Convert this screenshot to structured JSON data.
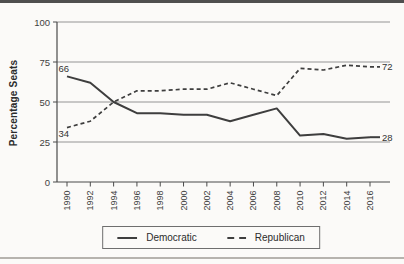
{
  "chart_data": {
    "type": "line",
    "title": "",
    "xlabel": "",
    "ylabel": "Percentage Seats",
    "x": [
      1990,
      1992,
      1994,
      1996,
      1998,
      2000,
      2002,
      2004,
      2006,
      2008,
      2010,
      2012,
      2014,
      2016
    ],
    "y_ticks": [
      0,
      25,
      50,
      75,
      100
    ],
    "ylim": [
      0,
      100
    ],
    "grid": "horizontal",
    "legend_position": "bottom-center",
    "series": [
      {
        "name": "Democratic",
        "style": "solid",
        "color": "#3e3e3e",
        "values": [
          66,
          62,
          50,
          43,
          43,
          42,
          42,
          38,
          42,
          46,
          29,
          30,
          27,
          28
        ],
        "start_label": "66",
        "start_label_pos": "above",
        "end_label": "28"
      },
      {
        "name": "Republican",
        "style": "dashed",
        "color": "#3e3e3e",
        "values": [
          34,
          38,
          50,
          57,
          57,
          58,
          58,
          62,
          58,
          54,
          71,
          70,
          73,
          72
        ],
        "start_label": "34",
        "start_label_pos": "below",
        "end_label": "72"
      }
    ]
  }
}
